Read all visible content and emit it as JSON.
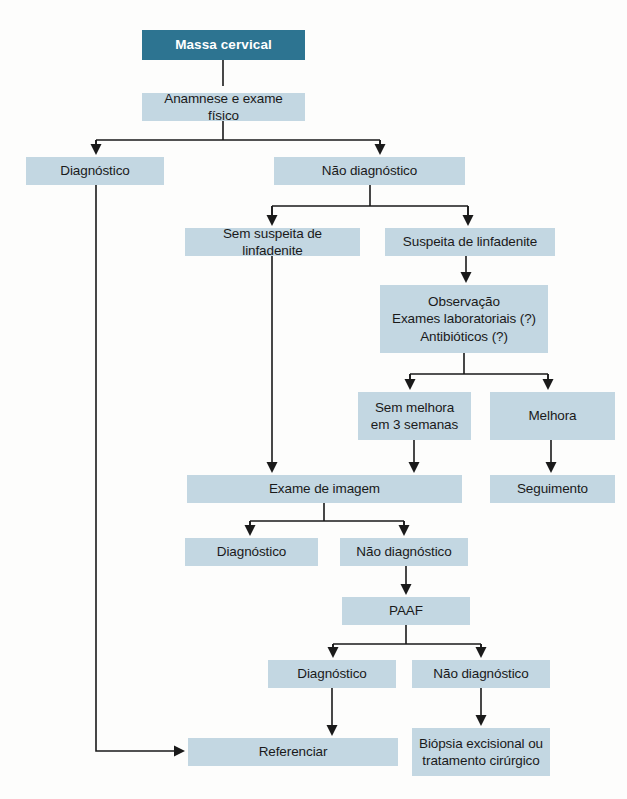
{
  "diagram": {
    "title": "Massa cervical",
    "type": "clinical-flowchart",
    "language": "pt-BR",
    "colors": {
      "root_fill": "#2d7491",
      "root_text": "#ffffff",
      "node_fill": "#c3d7e2",
      "node_text": "#1a1a1a",
      "edge": "#1a1a1a",
      "background": "#fdfdfc"
    },
    "nodes": [
      {
        "id": "massa-cervical",
        "label": "Massa cervical",
        "x": 142,
        "y": 30,
        "w": 163,
        "h": 30,
        "kind": "root"
      },
      {
        "id": "anamnese",
        "label": "Anamnese e exame físico",
        "x": 142,
        "y": 93,
        "w": 163,
        "h": 28,
        "kind": "step"
      },
      {
        "id": "diagnostico-1",
        "label": "Diagnóstico",
        "x": 26,
        "y": 157,
        "w": 138,
        "h": 28,
        "kind": "step"
      },
      {
        "id": "nao-diagnostico-1",
        "label": "Não diagnóstico",
        "x": 274,
        "y": 157,
        "w": 191,
        "h": 28,
        "kind": "step"
      },
      {
        "id": "sem-suspeita",
        "label": "Sem suspeita de linfadenite",
        "x": 185,
        "y": 228,
        "w": 175,
        "h": 28,
        "kind": "step"
      },
      {
        "id": "suspeita",
        "label": "Suspeita de linfadenite",
        "x": 385,
        "y": 228,
        "w": 170,
        "h": 28,
        "kind": "step"
      },
      {
        "id": "observacao",
        "label": "Observação\nExames laboratoriais (?)\nAntibióticos (?)",
        "x": 380,
        "y": 285,
        "w": 168,
        "h": 68,
        "kind": "step"
      },
      {
        "id": "sem-melhora",
        "label": "Sem melhora\nem 3 semanas",
        "x": 358,
        "y": 392,
        "w": 113,
        "h": 48,
        "kind": "step"
      },
      {
        "id": "melhora",
        "label": "Melhora",
        "x": 490,
        "y": 392,
        "w": 125,
        "h": 48,
        "kind": "step"
      },
      {
        "id": "exame-imagem",
        "label": "Exame de imagem",
        "x": 187,
        "y": 475,
        "w": 275,
        "h": 28,
        "kind": "step"
      },
      {
        "id": "seguimento",
        "label": "Seguimento",
        "x": 490,
        "y": 475,
        "w": 125,
        "h": 28,
        "kind": "step"
      },
      {
        "id": "diagnostico-2",
        "label": "Diagnóstico",
        "x": 185,
        "y": 538,
        "w": 133,
        "h": 28,
        "kind": "step"
      },
      {
        "id": "nao-diagnostico-2",
        "label": "Não diagnóstico",
        "x": 340,
        "y": 538,
        "w": 128,
        "h": 28,
        "kind": "step"
      },
      {
        "id": "paaf",
        "label": "PAAF",
        "x": 342,
        "y": 597,
        "w": 128,
        "h": 28,
        "kind": "step"
      },
      {
        "id": "diagnostico-3",
        "label": "Diagnóstico",
        "x": 268,
        "y": 660,
        "w": 128,
        "h": 28,
        "kind": "step"
      },
      {
        "id": "nao-diagnostico-3",
        "label": "Não diagnóstico",
        "x": 412,
        "y": 660,
        "w": 138,
        "h": 28,
        "kind": "step"
      },
      {
        "id": "referenciar",
        "label": "Referenciar",
        "x": 188,
        "y": 738,
        "w": 210,
        "h": 28,
        "kind": "step"
      },
      {
        "id": "biopsia",
        "label": "Biópsia excisional ou\ntratamento cirúrgico",
        "x": 412,
        "y": 728,
        "w": 138,
        "h": 48,
        "kind": "step"
      }
    ],
    "edges": [
      {
        "id": "e-massa-anamnese",
        "from": "massa-cervical",
        "to": "anamnese",
        "path": "M223,60 L223,86",
        "arrow": true
      },
      {
        "id": "e-anamnese-split",
        "from": "anamnese",
        "to": "split-1",
        "path": "M223,121 L223,140 M96,140 L380,140 M96,140 L96,150 M380,140 L380,150",
        "arrow": false
      },
      {
        "id": "e-split-diagnostico1",
        "from": "split-1",
        "to": "diagnostico-1",
        "path": "M96,140 L96,150",
        "arrow": true,
        "tip": [
          96,
          155
        ]
      },
      {
        "id": "e-split-naodiag1",
        "from": "split-1",
        "to": "nao-diagnostico-1",
        "path": "M380,140 L380,150",
        "arrow": true,
        "tip": [
          380,
          155
        ]
      },
      {
        "id": "e-naodiag1-split",
        "from": "nao-diagnostico-1",
        "to": "split-2",
        "path": "M370,185 L370,206 M272,206 L468,206 M272,206 L272,216 M468,206 L468,216",
        "arrow": false
      },
      {
        "id": "e-split2-semsuspeita",
        "from": "split-2",
        "to": "sem-suspeita",
        "path": "M272,206 L272,221",
        "arrow": true,
        "tip": [
          272,
          226
        ]
      },
      {
        "id": "e-split2-suspeita",
        "from": "split-2",
        "to": "suspeita",
        "path": "M468,206 L468,221",
        "arrow": true,
        "tip": [
          468,
          226
        ]
      },
      {
        "id": "e-suspeita-observacao",
        "from": "suspeita",
        "to": "observacao",
        "path": "M466,256 L466,278",
        "arrow": true,
        "tip": [
          466,
          283
        ]
      },
      {
        "id": "e-observacao-split",
        "from": "observacao",
        "to": "split-3",
        "path": "M464,353 L464,374 M410,374 L548,374 M410,374 L410,384 M548,374 L548,384",
        "arrow": false
      },
      {
        "id": "e-split3-semmelhora",
        "from": "split-3",
        "to": "sem-melhora",
        "path": "M410,374 L410,385",
        "arrow": true,
        "tip": [
          410,
          390
        ]
      },
      {
        "id": "e-split3-melhora",
        "from": "split-3",
        "to": "melhora",
        "path": "M548,374 L548,385",
        "arrow": true,
        "tip": [
          548,
          390
        ]
      },
      {
        "id": "e-semsuspeita-exame",
        "from": "sem-suspeita",
        "to": "exame-imagem",
        "path": "M272,256 L272,468",
        "arrow": true,
        "tip": [
          272,
          473
        ]
      },
      {
        "id": "e-semmelhora-exame",
        "from": "sem-melhora",
        "to": "exame-imagem",
        "path": "M414,440 L414,468",
        "arrow": true,
        "tip": [
          414,
          473
        ]
      },
      {
        "id": "e-melhora-seguimento",
        "from": "melhora",
        "to": "seguimento",
        "path": "M551,440 L551,468",
        "arrow": true,
        "tip": [
          551,
          473
        ]
      },
      {
        "id": "e-exame-split",
        "from": "exame-imagem",
        "to": "split-4",
        "path": "M324,503 L324,521 M250,521 L404,521 M250,521 L250,531 M404,521 L404,531",
        "arrow": false
      },
      {
        "id": "e-split4-diagnostico2",
        "from": "split-4",
        "to": "diagnostico-2",
        "path": "M250,521 L250,531",
        "arrow": true,
        "tip": [
          250,
          536
        ]
      },
      {
        "id": "e-split4-naodiag2",
        "from": "split-4",
        "to": "nao-diagnostico-2",
        "path": "M404,521 L404,531",
        "arrow": true,
        "tip": [
          404,
          536
        ]
      },
      {
        "id": "e-naodiag2-paaf",
        "from": "nao-diagnostico-2",
        "to": "paaf",
        "path": "M406,566 L406,590",
        "arrow": true,
        "tip": [
          406,
          595
        ]
      },
      {
        "id": "e-paaf-split",
        "from": "paaf",
        "to": "split-5",
        "path": "M406,625 L406,644 M333,644 L481,644 M333,644 L333,653 M481,644 L481,653",
        "arrow": false
      },
      {
        "id": "e-split5-diagnostico3",
        "from": "split-5",
        "to": "diagnostico-3",
        "path": "M333,644 L333,653",
        "arrow": true,
        "tip": [
          333,
          658
        ]
      },
      {
        "id": "e-split5-naodiag3",
        "from": "split-5",
        "to": "nao-diagnostico-3",
        "path": "M481,644 L481,653",
        "arrow": true,
        "tip": [
          481,
          658
        ]
      },
      {
        "id": "e-diagnostico3-ref",
        "from": "diagnostico-3",
        "to": "referenciar",
        "path": "M332,688 L332,731",
        "arrow": true,
        "tip": [
          332,
          736
        ]
      },
      {
        "id": "e-naodiag3-biopsia",
        "from": "nao-diagnostico-3",
        "to": "biopsia",
        "path": "M481,688 L481,721",
        "arrow": true,
        "tip": [
          481,
          726
        ]
      },
      {
        "id": "e-diagnostico1-ref",
        "from": "diagnostico-1",
        "to": "referenciar",
        "path": "M96,185 L96,751 L178,751",
        "arrow": true,
        "tip": [
          185,
          751
        ],
        "direction": "right"
      }
    ]
  }
}
